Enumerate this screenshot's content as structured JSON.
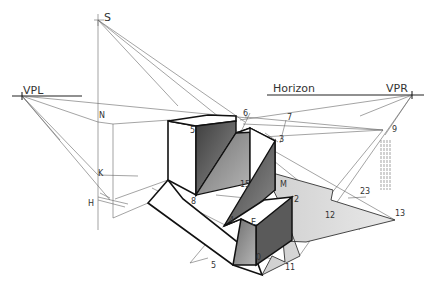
{
  "diagram": {
    "type": "two-point perspective shadow construction",
    "labels": {
      "vpl": "VPL",
      "vpr": "VPR",
      "horizon": "Horizon",
      "s": "S",
      "n": "N",
      "k": "K",
      "h": "H",
      "p5_top": "5",
      "p6": "6",
      "p7": "7",
      "p3": "3",
      "p9": "9",
      "p15": "15",
      "p8": "8",
      "pM": "M",
      "p2": "2",
      "p23": "23",
      "p4": "4",
      "pE": "E",
      "p12": "12",
      "p13": "13",
      "p5_bottom": "5",
      "p0": "0",
      "p11": "11"
    },
    "colors": {
      "line": "#555555",
      "outline": "#111111",
      "shade_dark": "#555555",
      "shade_mid": "#8a8a8a",
      "shadow_light": "#d6d6d6"
    }
  }
}
